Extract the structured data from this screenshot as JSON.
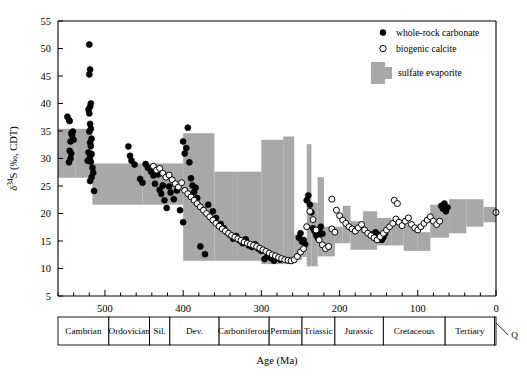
{
  "figure": {
    "axis_title_y": "δ34S (‰, CDT)",
    "axis_title_y_parts": {
      "delta": "δ",
      "sup": "34",
      "elem": "S",
      "unit": "(‰, CDT)"
    },
    "axis_title_x": "Age (Ma)",
    "quaternary_label": "Q"
  },
  "legend": {
    "items": [
      {
        "key": "whole-rock-carbonate",
        "label": "whole-rock carbonate",
        "marker": "filled-circle",
        "color": "#000000"
      },
      {
        "key": "biogenic-calcite",
        "label": "biogenic calcite",
        "marker": "open-circle",
        "color": "#ffffff"
      },
      {
        "key": "sulfate-evaporite",
        "label": "sulfate evaporite",
        "marker": "gray-swatch",
        "color": "#a8a8a8"
      }
    ]
  },
  "chart_data": {
    "type": "scatter",
    "title": "",
    "xlabel": "Age (Ma)",
    "ylabel": "δ34S (‰, CDT)",
    "xlim": [
      560,
      0
    ],
    "ylim": [
      5,
      55
    ],
    "x_ticks_major": [
      500,
      400,
      300,
      200,
      100,
      0
    ],
    "x_ticks_minor_step": 20,
    "y_ticks": [
      5,
      10,
      15,
      20,
      25,
      30,
      35,
      40,
      45,
      50,
      55
    ],
    "grid": false,
    "legend_position": "top-right",
    "x_direction": "reversed",
    "series": [
      {
        "name": "whole-rock carbonate",
        "marker": "filled-circle",
        "points": [
          [
            548,
            37.6
          ],
          [
            546,
            37.0
          ],
          [
            545,
            36.8
          ],
          [
            543,
            34.6
          ],
          [
            542,
            34.2
          ],
          [
            544,
            33.1
          ],
          [
            545,
            31.4
          ],
          [
            543,
            30.9
          ],
          [
            544,
            30.0
          ],
          [
            546,
            29.3
          ],
          [
            541,
            34.9
          ],
          [
            540,
            33.4
          ],
          [
            520,
            50.7
          ],
          [
            519,
            46.2
          ],
          [
            520,
            45.3
          ],
          [
            518,
            40.0
          ],
          [
            519,
            39.4
          ],
          [
            521,
            38.9
          ],
          [
            520,
            38.2
          ],
          [
            519,
            36.3
          ],
          [
            518,
            35.4
          ],
          [
            520,
            34.9
          ],
          [
            517,
            33.6
          ],
          [
            519,
            32.9
          ],
          [
            518,
            32.3
          ],
          [
            521,
            31.1
          ],
          [
            517,
            30.8
          ],
          [
            519,
            30.3
          ],
          [
            518,
            29.4
          ],
          [
            516,
            28.3
          ],
          [
            522,
            29.6
          ],
          [
            515,
            27.4
          ],
          [
            517,
            26.6
          ],
          [
            519,
            25.9
          ],
          [
            514,
            24.1
          ],
          [
            470,
            32.2
          ],
          [
            468,
            30.5
          ],
          [
            466,
            29.6
          ],
          [
            462,
            28.9
          ],
          [
            455,
            26.3
          ],
          [
            452,
            25.6
          ],
          [
            448,
            29.0
          ],
          [
            445,
            28.3
          ],
          [
            441,
            27.6
          ],
          [
            438,
            26.9
          ],
          [
            436,
            25.4
          ],
          [
            432,
            27.1
          ],
          [
            430,
            24.3
          ],
          [
            428,
            23.6
          ],
          [
            426,
            25.1
          ],
          [
            424,
            22.4
          ],
          [
            421,
            21.0
          ],
          [
            418,
            24.9
          ],
          [
            416,
            23.8
          ],
          [
            412,
            22.6
          ],
          [
            408,
            24.2
          ],
          [
            404,
            20.6
          ],
          [
            400,
            33.1
          ],
          [
            398,
            30.9
          ],
          [
            396,
            31.9
          ],
          [
            394,
            35.6
          ],
          [
            392,
            29.3
          ],
          [
            390,
            26.4
          ],
          [
            388,
            25.1
          ],
          [
            386,
            23.9
          ],
          [
            384,
            24.7
          ],
          [
            382,
            22.8
          ],
          [
            400,
            18.4
          ],
          [
            378,
            14.0
          ],
          [
            372,
            12.6
          ],
          [
            368,
            21.6
          ],
          [
            362,
            20.4
          ],
          [
            358,
            19.2
          ],
          [
            352,
            18.1
          ],
          [
            348,
            17.3
          ],
          [
            344,
            16.6
          ],
          [
            340,
            16.1
          ],
          [
            336,
            15.4
          ],
          [
            332,
            15.9
          ],
          [
            328,
            15.1
          ],
          [
            324,
            14.6
          ],
          [
            320,
            15.3
          ],
          [
            316,
            14.2
          ],
          [
            312,
            13.9
          ],
          [
            308,
            14.4
          ],
          [
            304,
            13.6
          ],
          [
            300,
            13.2
          ],
          [
            296,
            11.7
          ],
          [
            292,
            12.4
          ],
          [
            288,
            11.9
          ],
          [
            284,
            11.4
          ],
          [
            280,
            12.1
          ],
          [
            276,
            11.6
          ],
          [
            252,
            15.6
          ],
          [
            250,
            16.4
          ],
          [
            248,
            14.9
          ],
          [
            246,
            15.2
          ],
          [
            244,
            14.4
          ],
          [
            242,
            22.4
          ],
          [
            240,
            23.3
          ],
          [
            238,
            21.6
          ],
          [
            236,
            20.2
          ],
          [
            234,
            17.3
          ],
          [
            232,
            16.8
          ],
          [
            230,
            16.1
          ],
          [
            228,
            15.6
          ],
          [
            226,
            16.9
          ],
          [
            224,
            17.6
          ],
          [
            222,
            16.3
          ],
          [
            70,
            21.4
          ],
          [
            68,
            20.9
          ],
          [
            66,
            21.8
          ],
          [
            64,
            20.4
          ],
          [
            62,
            21.1
          ],
          [
            158,
            16.2
          ],
          [
            156,
            15.8
          ],
          [
            154,
            16.6
          ],
          [
            152,
            15.4
          ],
          [
            150,
            16.1
          ],
          [
            146,
            15.2
          ],
          [
            144,
            15.7
          ],
          [
            142,
            16.3
          ]
        ]
      },
      {
        "name": "biogenic calcite",
        "marker": "open-circle",
        "points": [
          [
            438,
            28.6
          ],
          [
            434,
            27.9
          ],
          [
            430,
            28.2
          ],
          [
            426,
            27.3
          ],
          [
            422,
            26.6
          ],
          [
            418,
            27.0
          ],
          [
            414,
            26.1
          ],
          [
            410,
            25.4
          ],
          [
            406,
            24.8
          ],
          [
            402,
            25.6
          ],
          [
            398,
            24.2
          ],
          [
            394,
            23.6
          ],
          [
            390,
            23.0
          ],
          [
            386,
            22.4
          ],
          [
            382,
            21.8
          ],
          [
            378,
            21.2
          ],
          [
            374,
            20.6
          ],
          [
            370,
            20.0
          ],
          [
            366,
            19.4
          ],
          [
            362,
            18.8
          ],
          [
            358,
            18.2
          ],
          [
            354,
            17.7
          ],
          [
            350,
            17.2
          ],
          [
            346,
            16.8
          ],
          [
            342,
            16.4
          ],
          [
            338,
            16.0
          ],
          [
            334,
            15.7
          ],
          [
            330,
            15.4
          ],
          [
            326,
            15.1
          ],
          [
            322,
            14.8
          ],
          [
            318,
            14.6
          ],
          [
            314,
            14.4
          ],
          [
            310,
            14.2
          ],
          [
            306,
            14.0
          ],
          [
            302,
            13.7
          ],
          [
            298,
            13.4
          ],
          [
            294,
            13.1
          ],
          [
            290,
            12.8
          ],
          [
            286,
            12.5
          ],
          [
            282,
            12.3
          ],
          [
            278,
            12.0
          ],
          [
            274,
            11.8
          ],
          [
            270,
            11.6
          ],
          [
            266,
            11.5
          ],
          [
            262,
            11.4
          ],
          [
            258,
            11.6
          ],
          [
            254,
            12.2
          ],
          [
            250,
            13.0
          ],
          [
            246,
            13.6
          ],
          [
            242,
            17.6
          ],
          [
            238,
            20.4
          ],
          [
            234,
            18.9
          ],
          [
            230,
            17.0
          ],
          [
            226,
            15.2
          ],
          [
            222,
            14.3
          ],
          [
            218,
            13.6
          ],
          [
            214,
            14.0
          ],
          [
            210,
            17.2
          ],
          [
            206,
            16.6
          ],
          [
            200,
            19.6
          ],
          [
            196,
            18.8
          ],
          [
            192,
            18.2
          ],
          [
            188,
            17.6
          ],
          [
            184,
            17.2
          ],
          [
            180,
            16.8
          ],
          [
            176,
            17.4
          ],
          [
            172,
            18.0
          ],
          [
            168,
            17.0
          ],
          [
            164,
            16.4
          ],
          [
            160,
            16.0
          ],
          [
            156,
            15.6
          ],
          [
            152,
            15.2
          ],
          [
            148,
            15.8
          ],
          [
            144,
            16.4
          ],
          [
            140,
            17.0
          ],
          [
            136,
            17.6
          ],
          [
            132,
            18.2
          ],
          [
            128,
            19.0
          ],
          [
            124,
            18.4
          ],
          [
            120,
            17.8
          ],
          [
            116,
            18.6
          ],
          [
            112,
            19.2
          ],
          [
            108,
            18.0
          ],
          [
            104,
            17.4
          ],
          [
            100,
            17.0
          ],
          [
            96,
            17.6
          ],
          [
            92,
            18.2
          ],
          [
            88,
            18.8
          ],
          [
            84,
            19.4
          ],
          [
            80,
            18.6
          ],
          [
            76,
            18.0
          ],
          [
            72,
            18.6
          ],
          [
            130,
            22.4
          ],
          [
            126,
            21.8
          ],
          [
            210,
            22.6
          ],
          [
            204,
            20.6
          ],
          [
            0,
            20.2
          ]
        ]
      }
    ],
    "evaporite_band": {
      "name": "sulfate evaporite",
      "color": "#a8a8a8",
      "description": "stepped gray envelope of sulfate evaporite δ34S through the Phanerozoic",
      "segments": [
        {
          "x_start": 560,
          "x_end": 538,
          "y_low": 26.5,
          "y_high": 35.4
        },
        {
          "x_start": 538,
          "x_end": 516,
          "y_low": 26.5,
          "y_high": 35.4
        },
        {
          "x_start": 516,
          "x_end": 452,
          "y_low": 21.6,
          "y_high": 29.1
        },
        {
          "x_start": 452,
          "x_end": 400,
          "y_low": 21.6,
          "y_high": 29.1
        },
        {
          "x_start": 400,
          "x_end": 360,
          "y_low": 11.4,
          "y_high": 34.6
        },
        {
          "x_start": 360,
          "x_end": 330,
          "y_low": 11.4,
          "y_high": 27.6
        },
        {
          "x_start": 330,
          "x_end": 300,
          "y_low": 11.4,
          "y_high": 27.6
        },
        {
          "x_start": 300,
          "x_end": 272,
          "y_low": 10.8,
          "y_high": 33.4
        },
        {
          "x_start": 272,
          "x_end": 258,
          "y_low": 10.8,
          "y_high": 34.0
        },
        {
          "x_start": 258,
          "x_end": 248,
          "y_low": 11.6,
          "y_high": 16.2
        },
        {
          "x_start": 248,
          "x_end": 242,
          "y_low": 12.1,
          "y_high": 14.6
        },
        {
          "x_start": 242,
          "x_end": 236,
          "y_low": 10.4,
          "y_high": 32.6
        },
        {
          "x_start": 236,
          "x_end": 228,
          "y_low": 10.4,
          "y_high": 22.0
        },
        {
          "x_start": 228,
          "x_end": 220,
          "y_low": 12.2,
          "y_high": 26.6
        },
        {
          "x_start": 220,
          "x_end": 206,
          "y_low": 12.2,
          "y_high": 17.6
        },
        {
          "x_start": 206,
          "x_end": 196,
          "y_low": 14.6,
          "y_high": 17.6
        },
        {
          "x_start": 196,
          "x_end": 186,
          "y_low": 14.6,
          "y_high": 21.4
        },
        {
          "x_start": 186,
          "x_end": 170,
          "y_low": 13.4,
          "y_high": 18.6
        },
        {
          "x_start": 170,
          "x_end": 152,
          "y_low": 13.4,
          "y_high": 20.4
        },
        {
          "x_start": 152,
          "x_end": 134,
          "y_low": 14.2,
          "y_high": 19.2
        },
        {
          "x_start": 134,
          "x_end": 118,
          "y_low": 14.2,
          "y_high": 18.8
        },
        {
          "x_start": 118,
          "x_end": 100,
          "y_low": 13.2,
          "y_high": 18.0
        },
        {
          "x_start": 100,
          "x_end": 84,
          "y_low": 13.2,
          "y_high": 16.6
        },
        {
          "x_start": 84,
          "x_end": 60,
          "y_low": 15.6,
          "y_high": 21.6
        },
        {
          "x_start": 60,
          "x_end": 38,
          "y_low": 16.4,
          "y_high": 22.6
        },
        {
          "x_start": 38,
          "x_end": 16,
          "y_low": 17.6,
          "y_high": 22.6
        },
        {
          "x_start": 16,
          "x_end": 0,
          "y_low": 18.4,
          "y_high": 21.2
        }
      ]
    }
  },
  "timescale": {
    "periods": [
      {
        "label": "Cambrian",
        "start": 560,
        "end": 495
      },
      {
        "label": "Ordovician",
        "start": 495,
        "end": 443
      },
      {
        "label": "Sil.",
        "start": 443,
        "end": 417
      },
      {
        "label": "Dev.",
        "start": 417,
        "end": 354
      },
      {
        "label": "Carboniferous",
        "start": 354,
        "end": 290
      },
      {
        "label": "Permian",
        "start": 290,
        "end": 248
      },
      {
        "label": "Triassic",
        "start": 248,
        "end": 206
      },
      {
        "label": "Jurassic",
        "start": 206,
        "end": 144
      },
      {
        "label": "Cretaceous",
        "start": 144,
        "end": 65
      },
      {
        "label": "Tertiary",
        "start": 65,
        "end": 2
      },
      {
        "label": "",
        "start": 2,
        "end": 0
      }
    ]
  }
}
